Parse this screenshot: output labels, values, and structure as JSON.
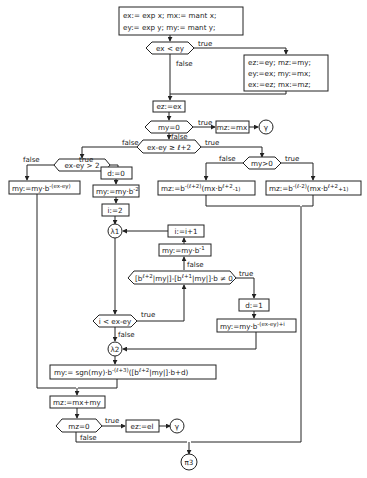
{
  "diagram": {
    "type": "flowchart",
    "nodes": {
      "init_1": "ex:= exp x; mx:= mant x;",
      "init_2": "ey:= exp y; my:= mant y;",
      "cond_ex_lt_ey": "ex < ey",
      "swap_1": "ez:=ey; mz:=my;",
      "swap_2": "ey:=ex; my:=mx;",
      "swap_3": "ex:=ez; mx:=mz;",
      "ez_ex": "ez:=ex",
      "cond_my_0": "my=0",
      "mz_mx": "mz:=mx",
      "gamma_1": "γ",
      "cond_diff_ge": "ex-ey ≥ ℓ+2",
      "cond_diff_gt2": "ex-ey > 2",
      "cond_my_gt0": "my>0",
      "my_shift_diff": "my:=my·b",
      "my_shift_diff_exp": "-(ex-ey)",
      "d_0": "d:=0",
      "my_shift_2": "my:=my·b",
      "my_shift_2_exp": "-2",
      "i_2": "i:=2",
      "lambda1": "λ1",
      "i_inc": "i:=i+1",
      "my_shift_1": "my:=my·b",
      "my_shift_1_exp": "-1",
      "mz_neg_a": "mz:=b",
      "mz_neg_a_exp1": "-(ℓ+2)",
      "mz_neg_a_mid": "(mx·b",
      "mz_neg_a_exp2": "ℓ+2",
      "mz_neg_a_tail": "-1)",
      "mz_pos_a": "mz:=b",
      "mz_pos_a_exp1": "-(ℓ-2)",
      "mz_pos_a_mid": "(mx·b",
      "mz_pos_a_exp2": "ℓ+2",
      "mz_pos_a_tail": "+1)",
      "cond_bracket_a": "[b",
      "cond_bracket_exp1": "ℓ+2",
      "cond_bracket_b": "|my|]-[b",
      "cond_bracket_exp2": "ℓ+1",
      "cond_bracket_c": "|my|]·b ≠ 0",
      "d_1": "d:=1",
      "my_shift_diff_i": "my:=my·b",
      "my_shift_diff_i_exp": "-(ex-ey)+i",
      "cond_i_lt": "i < ex-ey",
      "lambda2": "λ2",
      "final_my_a": "my:= sgn(my)·b",
      "final_my_exp1": "-(ℓ+3)",
      "final_my_b": "([b",
      "final_my_exp2": "ℓ+2",
      "final_my_c": "|my|]·b+d)",
      "mz_sum": "mz:=mx+my",
      "cond_mz_0": "mz=0",
      "ez_el": "ez:=el",
      "gamma_2": "γ",
      "pi3": "π3"
    },
    "edge_labels": {
      "true": "true",
      "false": "false"
    }
  }
}
